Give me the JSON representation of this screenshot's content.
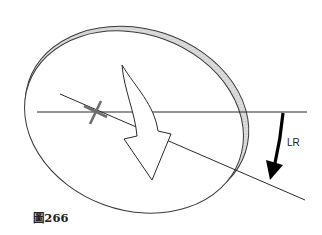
{
  "figure": {
    "caption": "圖266",
    "rotation_label": "LR"
  },
  "elements": {
    "disc": "tilted elliptical disc with shaded rim edges",
    "horizontal_reference_line": "horizontal axis line",
    "rotated_line": "line rotated clockwise from horizontal",
    "pivot_marker": "cross marker on rotated line",
    "curved_arrow": "large white curved arrow pointing down-right",
    "rotation_arrow": "black curved arrow indicating rotation LR"
  },
  "colors": {
    "stroke": "#2a2a2a",
    "rim_shade": "#cfcfcf",
    "marker": "#6e6e6e",
    "rotation_arrow": "#000000",
    "background": "#ffffff"
  }
}
